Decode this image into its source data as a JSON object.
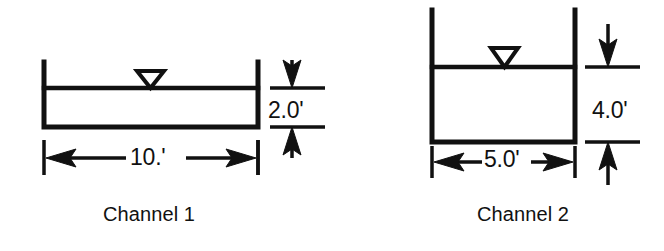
{
  "figure": {
    "stroke_color": "#111111",
    "background_color": "#ffffff",
    "channels": [
      {
        "id": "channel-1",
        "caption": "Channel 1",
        "width_label": "10.'",
        "depth_label": "2.0'",
        "width_value": 10.0,
        "depth_value": 2.0,
        "units": "ft",
        "water_surface_symbol": "inverted-triangle"
      },
      {
        "id": "channel-2",
        "caption": "Channel 2",
        "width_label": "5.0'",
        "depth_label": "4.0'",
        "width_value": 5.0,
        "depth_value": 4.0,
        "units": "ft",
        "water_surface_symbol": "inverted-triangle"
      }
    ]
  }
}
